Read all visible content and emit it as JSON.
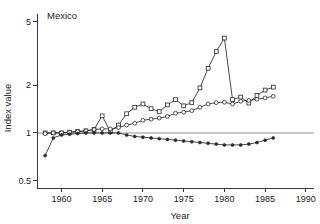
{
  "panel": {
    "title": "Mexico"
  },
  "chart_data": {
    "type": "line",
    "title": "Mexico",
    "xlabel": "Year",
    "ylabel": "Index value",
    "yscale": "log",
    "xlim": [
      1957,
      1991
    ],
    "ylim": [
      0.45,
      5.6
    ],
    "grid": false,
    "legend": "none",
    "reference_line": {
      "y": 1,
      "color": "#c9c9c9",
      "label": "index = 1"
    },
    "yticks": [
      0.5,
      1,
      2,
      5
    ],
    "yticklabels": [
      "0.5",
      "1",
      "2",
      "5"
    ],
    "xticks": [
      1960,
      1965,
      1970,
      1975,
      1980,
      1985,
      1990
    ],
    "xticklabels": [
      "1960",
      "1965",
      "1970",
      "1975",
      "1980",
      "1985",
      "1990"
    ],
    "series": [
      {
        "name": "series-peak",
        "marker": "open-square",
        "x": [
          1958,
          1959,
          1960,
          1961,
          1962,
          1963,
          1964,
          1965,
          1966,
          1967,
          1968,
          1969,
          1970,
          1971,
          1972,
          1973,
          1974,
          1975,
          1976,
          1977,
          1978,
          1979,
          1980,
          1981,
          1982,
          1983,
          1984,
          1985,
          1986
        ],
        "y": [
          1.0,
          1.0,
          1.0,
          1.01,
          1.02,
          1.03,
          1.05,
          1.28,
          1.02,
          1.12,
          1.32,
          1.45,
          1.52,
          1.42,
          1.36,
          1.5,
          1.62,
          1.48,
          1.55,
          1.92,
          2.55,
          3.25,
          3.95,
          1.62,
          1.68,
          1.54,
          1.72,
          1.86,
          1.94
        ]
      },
      {
        "name": "series-middle",
        "marker": "open-circle",
        "x": [
          1958,
          1959,
          1960,
          1961,
          1962,
          1963,
          1964,
          1965,
          1966,
          1967,
          1968,
          1969,
          1970,
          1971,
          1972,
          1973,
          1974,
          1975,
          1976,
          1977,
          1978,
          1979,
          1980,
          1981,
          1982,
          1983,
          1984,
          1985,
          1986
        ],
        "y": [
          0.99,
          1.0,
          1.0,
          1.01,
          1.02,
          1.03,
          1.05,
          1.06,
          1.06,
          1.08,
          1.12,
          1.15,
          1.2,
          1.22,
          1.24,
          1.27,
          1.33,
          1.35,
          1.38,
          1.45,
          1.52,
          1.55,
          1.56,
          1.52,
          1.58,
          1.6,
          1.63,
          1.66,
          1.7
        ]
      },
      {
        "name": "series-low",
        "marker": "filled",
        "x": [
          1958,
          1959,
          1960,
          1961,
          1962,
          1963,
          1964,
          1965,
          1966,
          1967,
          1968,
          1969,
          1970,
          1971,
          1972,
          1973,
          1974,
          1975,
          1976,
          1977,
          1978,
          1979,
          1980,
          1981,
          1982,
          1983,
          1984,
          1985,
          1986
        ],
        "y": [
          0.72,
          0.93,
          0.97,
          0.98,
          0.99,
          1.0,
          1.0,
          1.0,
          1.0,
          1.0,
          0.97,
          0.95,
          0.94,
          0.93,
          0.92,
          0.91,
          0.9,
          0.89,
          0.88,
          0.87,
          0.86,
          0.85,
          0.84,
          0.84,
          0.84,
          0.85,
          0.87,
          0.9,
          0.93
        ]
      }
    ]
  }
}
